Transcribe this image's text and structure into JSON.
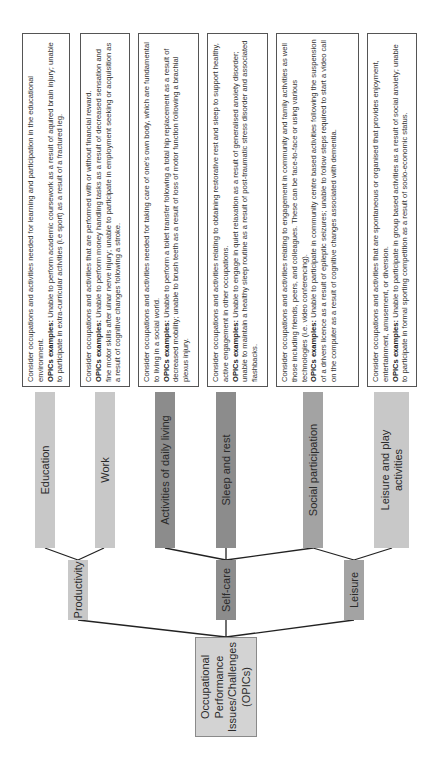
{
  "root": {
    "label": "Occupational Performance Issues/Challenges (OPICs)"
  },
  "domains": [
    {
      "label": "Productivity"
    },
    {
      "label": "Self-care"
    },
    {
      "label": "Leisure"
    }
  ],
  "occupations": [
    {
      "label": "Education",
      "description": "Consider occupations and activities needed for learning and participation in the educational environment.",
      "examples_label": "OPICs examples:",
      "examples": "Unable to perform academic coursework as a result of aquired brain injury; unable to participate in extra-curricular activities (i.e sport) as a result of a fractured leg."
    },
    {
      "label": "Work",
      "description": "Consider occupations and activities that are performed with or without financial reward.",
      "examples_label": "OPICs examples:",
      "examples": "Unable to perform money handling tasks as a result of decreased sensation and fine motor skills after ulnar nerve injury; unable to participate in employment seeking or acquisition as a result of cognitive changes following a stroke."
    },
    {
      "label": "Activities of daily living",
      "description": "Consider occupations and activities needed for taking care of one's own body, which are fundamental to living in a social world.",
      "examples_label": "OPICs examples:",
      "examples": "Unable to perform a toilet transfer following a total hip replacement as a result of decreased mobility; unable to brush teeth as a result of loss of motor function following a brachial plexus injury."
    },
    {
      "label": "Sleep and rest",
      "description": "Consider occupations and activities relating to obtaining restorative rest and sleep to support healthy, active engagement in other occupations.",
      "examples_label": "OPICs examples:",
      "examples": "Unable to engage in quiet relaxation as a result of generalised anxiety disorder; unable to maintain a healthy sleep routine as a result of post-traumatic stress disorder and associated flashbacks."
    },
    {
      "label": "Social participation",
      "description": "Consider occupations and activities relating to engagement in community and family activities as well those including friends, peers, and colleagues. These can be face-to-face or using various technologies (i.e. video conferencing).",
      "examples_label": "OPICs examples:",
      "examples": "Unable to participate in community centre based activities following the suspension of a drivers licence as a result of epileptic seizures; unable to follow steps required to start a video call on the computer as a result of cognitive changes associated with dementia."
    },
    {
      "label": "Leisure and play activities",
      "description": "Consider occupations and activities that are spontaneous or organised that provides enjoyment, entertainment, amusement, or diversion.",
      "examples_label": "OPICs examples:",
      "examples": "Unable to participate in group based activities as a result of social anxiety; unable to participate in formal sporting competition as a result of socio-economic status."
    }
  ],
  "colors": {
    "light_bar": "#c8c8c8",
    "mid_bar": "#a3a3a3",
    "dark_bar": "#8c8c8c",
    "root_fill": "#d3d3d3",
    "line": "#222222"
  }
}
